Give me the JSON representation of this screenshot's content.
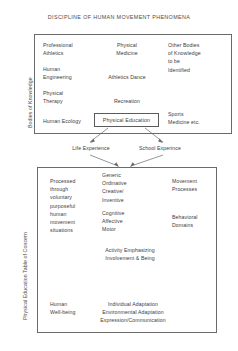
{
  "diagram": {
    "title": "DISCIPLINE OF HUMAN MOVEMENT PHENOMENA",
    "axis_labels": {
      "top": "Bodies of Knowledge",
      "bottom": "Physical Education Table of Concern"
    },
    "central_node": "Physical Education",
    "bridge_labels": {
      "left": "Life Experience",
      "right": "School Experince"
    },
    "top_box": {
      "left_column": [
        "Professional\nAthletics",
        "Human\nEngineering",
        "Physical\nTherapy",
        "Human Ecology"
      ],
      "middle_column": [
        "Physical\nMedicine",
        "Athletics  Dance",
        "Recreation"
      ],
      "right_column": [
        "Other Bodies\nof Knowledge\nto be\nIdentified",
        "Sports\nMedicine etc."
      ]
    },
    "bottom_box": {
      "left_column": [
        "Processed\nthrough\nvoluntary\npurposeful\nhuman\nmovement\nsituations",
        "Human\nWell-being"
      ],
      "middle_column": [
        "Generic\nOrdinative\nCreative/\nInventive",
        "Cognitive\nAffective\nMotor",
        "Activity Emphasizing\nInvolvement & Being",
        "Individual Adaptation\nEnvironmental Adaptation\nExpression/Communication"
      ],
      "right_column": [
        "Movement\nProcesses",
        "Behavioral\nDomains"
      ]
    },
    "colors": {
      "ink": "#3d3d3d",
      "stroke": "#6a6a6a",
      "background": "#ffffff"
    }
  }
}
